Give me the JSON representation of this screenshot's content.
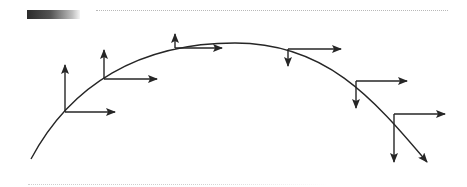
{
  "diagram": {
    "stroke_color": "#262626",
    "curve": {
      "start": [
        31,
        159
      ],
      "peak": [
        235,
        43
      ],
      "end": [
        427,
        162
      ],
      "end_has_arrow": true
    },
    "points": [
      {
        "origin": [
          65,
          112
        ],
        "horizontal_tip": [
          115,
          112
        ],
        "vertical_tip": [
          65,
          65
        ],
        "vertical_direction": "up"
      },
      {
        "origin": [
          104,
          79
        ],
        "horizontal_tip": [
          157,
          79
        ],
        "vertical_tip": [
          104,
          50
        ],
        "vertical_direction": "up"
      },
      {
        "origin": [
          175,
          48
        ],
        "horizontal_tip": [
          222,
          48
        ],
        "vertical_tip": [
          175,
          34
        ],
        "vertical_direction": "up"
      },
      {
        "origin": [
          288,
          49
        ],
        "horizontal_tip": [
          341,
          49
        ],
        "vertical_tip": [
          288,
          66
        ],
        "vertical_direction": "down"
      },
      {
        "origin": [
          356,
          81
        ],
        "horizontal_tip": [
          407,
          81
        ],
        "vertical_tip": [
          356,
          108
        ],
        "vertical_direction": "down"
      },
      {
        "origin": [
          394,
          114
        ],
        "horizontal_tip": [
          445,
          114
        ],
        "vertical_tip": [
          394,
          162
        ],
        "vertical_direction": "down"
      }
    ]
  },
  "decorations": {
    "gradient_bar": {
      "from": "#2b2b2b",
      "to": "#f4f4f4"
    },
    "top_rule": "dotted",
    "bottom_rule": "dotted"
  }
}
